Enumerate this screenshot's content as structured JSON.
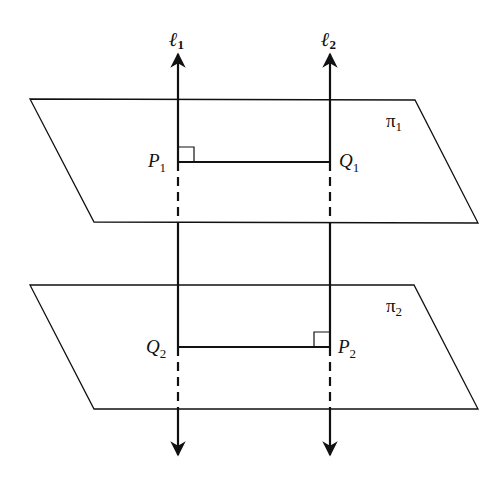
{
  "diagram": {
    "title": "",
    "lines": [
      {
        "id": "l1",
        "label": "ℓ",
        "subscript": "1"
      },
      {
        "id": "l2",
        "label": "ℓ",
        "subscript": "2"
      }
    ],
    "planes": [
      {
        "id": "pi1",
        "label": "π",
        "subscript": "1"
      },
      {
        "id": "pi2",
        "label": "π",
        "subscript": "2"
      }
    ],
    "points": [
      {
        "id": "P1",
        "label": "P",
        "subscript": "1"
      },
      {
        "id": "Q1",
        "label": "Q",
        "subscript": "1"
      },
      {
        "id": "Q2",
        "label": "Q",
        "subscript": "2"
      },
      {
        "id": "P2",
        "label": "P",
        "subscript": "2"
      }
    ],
    "colors": {
      "stroke": "#111111",
      "background": "#ffffff"
    }
  }
}
